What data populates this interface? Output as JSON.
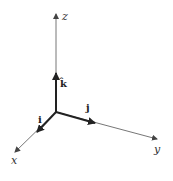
{
  "diagram": {
    "title": "",
    "origin": {
      "x": 56,
      "y": 112
    },
    "colors": {
      "axis": "#555555",
      "vector": "#222222",
      "background": "#ffffff"
    },
    "axes": [
      {
        "name": "z",
        "label": "z",
        "end": {
          "x": 56,
          "y": 14
        },
        "label_pos": {
          "x": 62,
          "y": 20
        }
      },
      {
        "name": "y",
        "label": "y",
        "end": {
          "x": 157,
          "y": 139
        },
        "label_pos": {
          "x": 155,
          "y": 153
        }
      },
      {
        "name": "x",
        "label": "x",
        "end": {
          "x": 15,
          "y": 152
        },
        "label_pos": {
          "x": 11,
          "y": 164
        }
      }
    ],
    "unit_vectors": [
      {
        "name": "k",
        "label": "k̂",
        "end": {
          "x": 56,
          "y": 73
        },
        "label_pos": {
          "x": 60,
          "y": 86
        }
      },
      {
        "name": "j",
        "label": "j",
        "end": {
          "x": 95,
          "y": 123
        },
        "label_pos": {
          "x": 86,
          "y": 111
        }
      },
      {
        "name": "i",
        "label": "i",
        "end": {
          "x": 37,
          "y": 132
        },
        "label_pos": {
          "x": 38,
          "y": 123
        }
      }
    ]
  }
}
